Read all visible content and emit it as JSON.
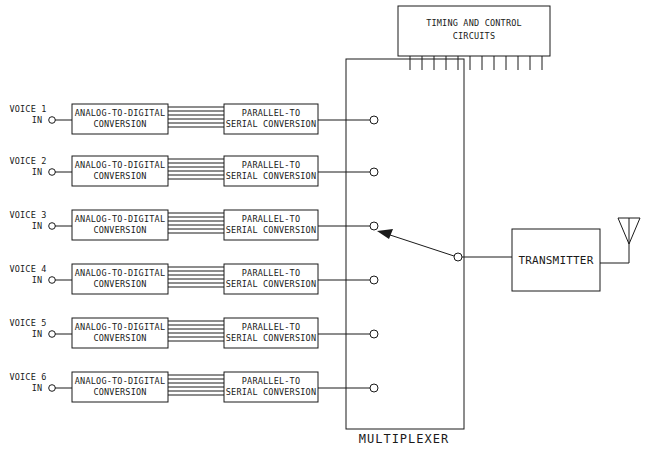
{
  "diagram": {
    "timing": {
      "line1": "TIMING AND CONTROL",
      "line2": "CIRCUITS"
    },
    "multiplexer_label": "MULTIPLEXER",
    "transmitter_label": "TRANSMITTER",
    "channels": [
      {
        "voice": "VOICE 1",
        "in": "IN",
        "adc1": "ANALOG-TO-DIGITAL",
        "adc2": "CONVERSION",
        "ps1": "PARALLEL-TO",
        "ps2": "SERIAL CONVERSION"
      },
      {
        "voice": "VOICE 2",
        "in": "IN",
        "adc1": "ANALOG-TO-DIGITAL",
        "adc2": "CONVERSION",
        "ps1": "PARALLEL-TO",
        "ps2": "SERIAL CONVERSION"
      },
      {
        "voice": "VOICE 3",
        "in": "IN",
        "adc1": "ANALOG-TO-DIGITAL",
        "adc2": "CONVERSION",
        "ps1": "PARALLEL-TO",
        "ps2": "SERIAL CONVERSION"
      },
      {
        "voice": "VOICE 4",
        "in": "IN",
        "adc1": "ANALOG-TO-DIGITAL",
        "adc2": "CONVERSION",
        "ps1": "PARALLEL-TO",
        "ps2": "SERIAL CONVERSION"
      },
      {
        "voice": "VOICE 5",
        "in": "IN",
        "adc1": "ANALOG-TO-DIGITAL",
        "adc2": "CONVERSION",
        "ps1": "PARALLEL-TO",
        "ps2": "SERIAL CONVERSION"
      },
      {
        "voice": "VOICE 6",
        "in": "IN",
        "adc1": "ANALOG-TO-DIGITAL",
        "adc2": "CONVERSION",
        "ps1": "PARALLEL-TO",
        "ps2": "SERIAL CONVERSION"
      }
    ],
    "selected_channel": 3,
    "stroke_color": "#1a1a1a"
  }
}
